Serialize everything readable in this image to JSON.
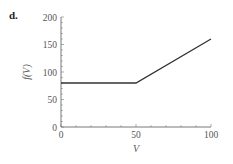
{
  "panel": {
    "label": "d."
  },
  "chart_data": {
    "type": "line",
    "title": "",
    "xlabel": "V",
    "ylabel": "f(V)",
    "xlim": [
      0,
      100
    ],
    "ylim": [
      0,
      200
    ],
    "xticks": [
      0,
      50,
      100
    ],
    "yticks": [
      0,
      50,
      100,
      150,
      200
    ],
    "xtick_labels": [
      "0",
      "50",
      "100"
    ],
    "ytick_labels": [
      "0",
      "50",
      "100",
      "150",
      "200"
    ],
    "grid": false,
    "legend": null,
    "series": [
      {
        "name": "f(V)",
        "x": [
          0,
          50,
          100
        ],
        "y": [
          80,
          80,
          160
        ],
        "color": "#333333"
      }
    ]
  }
}
